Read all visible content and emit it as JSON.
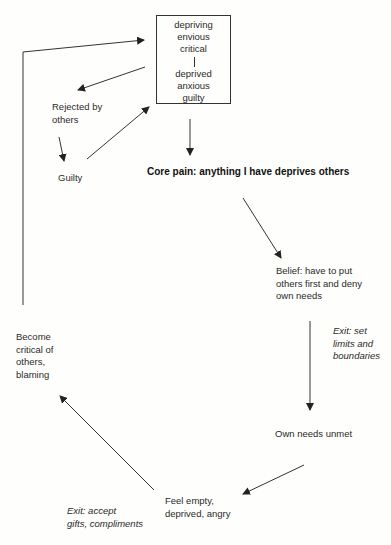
{
  "diagram": {
    "type": "cycle-flowchart",
    "box": {
      "top_states": [
        "depriving",
        "envious",
        "critical"
      ],
      "bottom_states": [
        "deprived",
        "anxious",
        "guilty"
      ]
    },
    "nodes": {
      "rejected": "Rejected by others",
      "guilty": "Guilty",
      "core_pain": "Core pain: anything I have deprives others",
      "belief": [
        "Belief: have to put",
        "others first and deny",
        "own needs"
      ],
      "exit_boundaries": [
        "Exit: set",
        "limits and",
        "boundaries"
      ],
      "needs_unmet": "Own needs unmet",
      "feel_empty": [
        "Feel empty,",
        "deprived, angry"
      ],
      "exit_gifts": [
        "Exit:  accept",
        "gifts, compliments"
      ],
      "become_critical": [
        "Become",
        "critical of",
        "others,",
        "blaming"
      ]
    },
    "edges": [
      {
        "from": "box",
        "to": "rejected"
      },
      {
        "from": "rejected",
        "to": "guilty"
      },
      {
        "from": "guilty",
        "to": "box"
      },
      {
        "from": "box",
        "to": "core_pain"
      },
      {
        "from": "core_pain",
        "to": "belief"
      },
      {
        "from": "belief",
        "to": "needs_unmet",
        "label": "exit_boundaries"
      },
      {
        "from": "needs_unmet",
        "to": "feel_empty"
      },
      {
        "from": "feel_empty",
        "to": "become_critical",
        "label": "exit_gifts"
      },
      {
        "from": "become_critical",
        "to": "box"
      }
    ],
    "colors": {
      "line": "#333333",
      "text": "#2a2a2a",
      "background": "#fefefc"
    }
  }
}
